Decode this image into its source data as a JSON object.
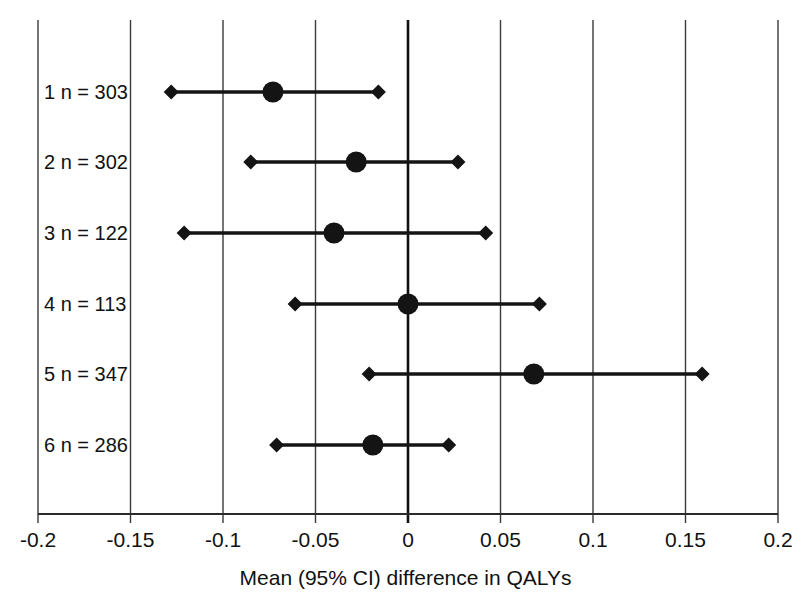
{
  "chart_data": {
    "type": "scatter",
    "subtype": "forest-plot",
    "title": "",
    "xlabel": "Mean (95% CI) difference in QALYs",
    "ylabel": "",
    "xlim": [
      -0.2,
      0.2
    ],
    "xticks": [
      -0.2,
      -0.15,
      -0.1,
      -0.05,
      0,
      0.05,
      0.1,
      0.15,
      0.2
    ],
    "xticklabels": [
      "-0.2",
      "-0.15",
      "-0.1",
      "-0.05",
      "0",
      "0.05",
      "0.1",
      "0.15",
      "0.2"
    ],
    "grid": "vertical-only",
    "reference_line": 0,
    "legend": null,
    "categories": [
      "1 n = 303",
      "2 n = 302",
      "3 n = 122",
      "4 n = 113",
      "5 n = 347",
      "6 n = 286"
    ],
    "series": [
      {
        "name": "Mean (95% CI) difference in QALYs",
        "point_marker": "filled-circle",
        "interval_marker": "filled-diamond",
        "color": "#141414",
        "points": [
          {
            "label": "1 n = 303",
            "study": 1,
            "n": 303,
            "mean": -0.073,
            "ci_low": -0.128,
            "ci_high": -0.016
          },
          {
            "label": "2 n = 302",
            "study": 2,
            "n": 302,
            "mean": -0.028,
            "ci_low": -0.085,
            "ci_high": 0.027
          },
          {
            "label": "3 n = 122",
            "study": 3,
            "n": 122,
            "mean": -0.04,
            "ci_low": -0.121,
            "ci_high": 0.042
          },
          {
            "label": "4 n = 113",
            "study": 4,
            "n": 113,
            "mean": 0.0,
            "ci_low": -0.061,
            "ci_high": 0.071
          },
          {
            "label": "5 n = 347",
            "study": 5,
            "n": 347,
            "mean": 0.068,
            "ci_low": -0.021,
            "ci_high": 0.159
          },
          {
            "label": "6 n = 286",
            "study": 6,
            "n": 286,
            "mean": -0.019,
            "ci_low": -0.071,
            "ci_high": 0.022
          }
        ]
      }
    ]
  },
  "colors": {
    "marker": "#141414",
    "grid": "#3a3a3a",
    "axis": "#2a2a2a",
    "zero_line": "#111111",
    "background": "#ffffff",
    "text": "#111111"
  }
}
